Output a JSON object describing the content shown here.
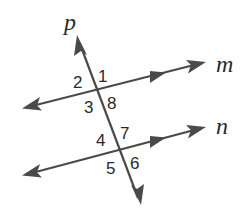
{
  "diagram": {
    "type": "parallel lines cut by a transversal",
    "colors": {
      "line": "#4a4a4a",
      "text": "#2a2a2a",
      "background": "#ffffff"
    },
    "lines": {
      "p": {
        "label": "p",
        "role": "transversal"
      },
      "m": {
        "label": "m",
        "role": "parallel line",
        "parallel_marker": "single arrow"
      },
      "n": {
        "label": "n",
        "role": "parallel line",
        "parallel_marker": "single arrow"
      }
    },
    "angles": {
      "a1": "1",
      "a2": "2",
      "a3": "3",
      "a4": "4",
      "a5": "5",
      "a6": "6",
      "a7": "7",
      "a8": "8"
    }
  }
}
